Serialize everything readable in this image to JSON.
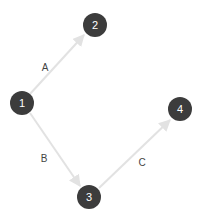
{
  "diagram": {
    "type": "directed-graph",
    "nodes": [
      {
        "id": "1",
        "label": "1",
        "x": 22,
        "y": 103
      },
      {
        "id": "2",
        "label": "2",
        "x": 95,
        "y": 25
      },
      {
        "id": "3",
        "label": "3",
        "x": 89,
        "y": 197
      },
      {
        "id": "4",
        "label": "4",
        "x": 180,
        "y": 109
      }
    ],
    "edges": [
      {
        "from": "1",
        "to": "2",
        "label": "A",
        "label_x": 45,
        "label_y": 67
      },
      {
        "from": "1",
        "to": "3",
        "label": "B",
        "label_x": 44,
        "label_y": 158
      },
      {
        "from": "3",
        "to": "4",
        "label": "C",
        "label_x": 142,
        "label_y": 162
      }
    ],
    "colors": {
      "node_fill": "#3c3c3c",
      "node_text": "#ffffff",
      "edge": "#e2e2e2",
      "edge_label": "#444444",
      "background": "#ffffff"
    }
  }
}
